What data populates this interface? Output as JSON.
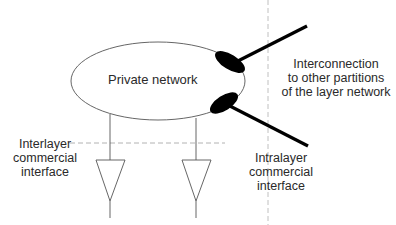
{
  "diagram": {
    "title": "",
    "nodes": {
      "private_network": {
        "label": "Private network"
      },
      "interconnection": {
        "lines": [
          "Interconnection",
          "to other partitions",
          "of the layer network"
        ]
      },
      "interlayer": {
        "lines": [
          "Interlayer",
          "commercial",
          "interface"
        ]
      },
      "intralayer": {
        "lines": [
          "Intralayer",
          "commercial",
          "interface"
        ]
      }
    },
    "colors": {
      "outline": "#555555",
      "thick_link": "#000000",
      "dashed": "#999999",
      "text": "#2a2a2a"
    },
    "elements": [
      "Ellipse labeled Private network",
      "Two black elliptical connection points on the right of the ellipse",
      "Two thick links exiting the connection points to other partitions",
      "Vertical dashed boundary line",
      "Horizontal dashed boundary line",
      "Two downward triangles (adaptation functions) connected below the ellipse"
    ]
  }
}
